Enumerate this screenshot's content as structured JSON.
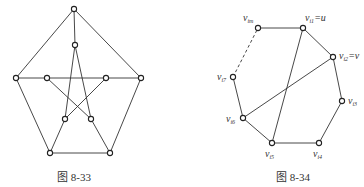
{
  "figures": [
    {
      "id": "fig-8-33",
      "caption": "图 8-33",
      "description": "Petersen graph: outer pentagon, inner pentagram, spokes",
      "nodes": [
        {
          "id": "o1",
          "x": 74,
          "y": 9
        },
        {
          "id": "o2",
          "x": 141,
          "y": 78
        },
        {
          "id": "o3",
          "x": 110,
          "y": 153
        },
        {
          "id": "o4",
          "x": 50,
          "y": 153
        },
        {
          "id": "o5",
          "x": 16,
          "y": 78
        },
        {
          "id": "i1",
          "x": 75,
          "y": 45
        },
        {
          "id": "i2",
          "x": 106,
          "y": 78
        },
        {
          "id": "i3",
          "x": 91,
          "y": 119
        },
        {
          "id": "i4",
          "x": 65,
          "y": 119
        },
        {
          "id": "i5",
          "x": 47,
          "y": 78
        }
      ],
      "edges": [
        [
          "o1",
          "o2"
        ],
        [
          "o2",
          "o3"
        ],
        [
          "o3",
          "o4"
        ],
        [
          "o4",
          "o5"
        ],
        [
          "o5",
          "o1"
        ],
        [
          "o1",
          "i1"
        ],
        [
          "o2",
          "i2"
        ],
        [
          "o3",
          "i3"
        ],
        [
          "o4",
          "i4"
        ],
        [
          "o5",
          "i5"
        ],
        [
          "i1",
          "i3"
        ],
        [
          "i3",
          "i5"
        ],
        [
          "i5",
          "i2"
        ],
        [
          "i2",
          "i4"
        ],
        [
          "i4",
          "i1"
        ]
      ]
    },
    {
      "id": "fig-8-34",
      "caption": "图 8-34",
      "description": "Cycle v_i1 ... v_im with chords u-v_i5 and v-v_i6; edge v_i7-v_im dashed",
      "nodes": [
        {
          "id": "vim",
          "x": 258,
          "y": 28,
          "label": "v",
          "sub": "im",
          "suffix": "",
          "lx": 243,
          "ly": 21
        },
        {
          "id": "vi1",
          "x": 303,
          "y": 28,
          "label": "v",
          "sub": "i1",
          "suffix": "=u",
          "lx": 305,
          "ly": 21
        },
        {
          "id": "vi2",
          "x": 333,
          "y": 57,
          "label": "v",
          "sub": "i2",
          "suffix": "=v",
          "lx": 339,
          "ly": 59
        },
        {
          "id": "vi3",
          "x": 342,
          "y": 101,
          "label": "v",
          "sub": "i3",
          "suffix": "",
          "lx": 348,
          "ly": 104
        },
        {
          "id": "vi4",
          "x": 319,
          "y": 143,
          "label": "v",
          "sub": "i4",
          "suffix": "",
          "lx": 313,
          "ly": 157
        },
        {
          "id": "vi5",
          "x": 272,
          "y": 143,
          "label": "v",
          "sub": "i5",
          "suffix": "",
          "lx": 265,
          "ly": 157
        },
        {
          "id": "vi6",
          "x": 243,
          "y": 118,
          "label": "v",
          "sub": "i6",
          "suffix": "",
          "lx": 226,
          "ly": 122
        },
        {
          "id": "vi7",
          "x": 233,
          "y": 77,
          "label": "v",
          "sub": "i7",
          "suffix": "",
          "lx": 217,
          "ly": 80
        }
      ],
      "edges": [
        {
          "a": "vim",
          "b": "vi1",
          "dashed": false
        },
        {
          "a": "vi1",
          "b": "vi2",
          "dashed": false
        },
        {
          "a": "vi2",
          "b": "vi3",
          "dashed": false
        },
        {
          "a": "vi3",
          "b": "vi4",
          "dashed": false
        },
        {
          "a": "vi4",
          "b": "vi5",
          "dashed": false
        },
        {
          "a": "vi5",
          "b": "vi6",
          "dashed": false
        },
        {
          "a": "vi6",
          "b": "vi7",
          "dashed": false
        },
        {
          "a": "vi7",
          "b": "vim",
          "dashed": true
        },
        {
          "a": "vi1",
          "b": "vi5",
          "dashed": false
        },
        {
          "a": "vi2",
          "b": "vi6",
          "dashed": false
        }
      ]
    }
  ],
  "captions": {
    "left": "图 8-33",
    "right": "图 8-34"
  },
  "colors": {
    "stroke": "#333333",
    "node_fill": "#ffffff",
    "background": "#ffffff"
  }
}
